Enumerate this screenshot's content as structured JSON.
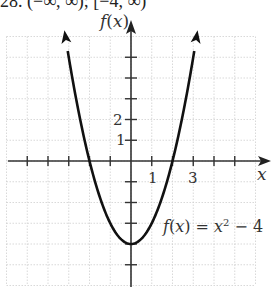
{
  "header": {
    "text": "28. (−∞, ∞); [−4, ∞)"
  },
  "chart_data": {
    "type": "line",
    "title": "",
    "function_label": "f(x) = x² − 4",
    "xlabel": "x",
    "ylabel": "f(x)",
    "xlim": [
      -6,
      6
    ],
    "ylim": [
      -6,
      6
    ],
    "grid": true,
    "x_tick_labels": [
      {
        "value": 1,
        "label": "1"
      },
      {
        "value": 3,
        "label": "3"
      }
    ],
    "y_tick_labels": [
      {
        "value": 1,
        "label": "1"
      },
      {
        "value": 2,
        "label": "2"
      }
    ],
    "x_ticks": [
      -5,
      -4,
      -3,
      -2,
      -1,
      1,
      2,
      3,
      4,
      5
    ],
    "y_ticks": [
      -5,
      -4,
      -3,
      -2,
      -1,
      1,
      2,
      3,
      4,
      5
    ],
    "series": [
      {
        "name": "f(x) = x² − 4",
        "expression": "x^2 - 4",
        "x": [
          -3.16,
          -3,
          -2,
          -1,
          0,
          1,
          2,
          3,
          3.16
        ],
        "y": [
          6,
          5,
          0,
          -3,
          -4,
          -3,
          0,
          5,
          6
        ]
      }
    ],
    "vertex": [
      0,
      -4
    ],
    "x_intercepts": [
      -2,
      2
    ]
  },
  "labels": {
    "fx": "f(x)",
    "x": "x",
    "tick_1x": "1",
    "tick_3x": "3",
    "tick_1y": "1",
    "tick_2y": "2",
    "eq_f": "f",
    "eq_rest": "(x) = x",
    "eq_exp": "2",
    "eq_tail": " − 4"
  }
}
